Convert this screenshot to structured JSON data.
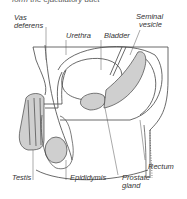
{
  "figure": {
    "caption_partial": "form the ejaculatory duct",
    "labels": {
      "vas_deferens_line1": "Vas",
      "vas_deferens_line2": "deferens",
      "urethra": "Urethra",
      "bladder": "Bladder",
      "seminal_vesicle_line1": "Seminal",
      "seminal_vesicle_line2": "vesicle",
      "rectum": "Rectum",
      "testis": "Testis",
      "epididymis": "Epididymis",
      "prostate_gland_line1": "Prostate",
      "prostate_gland_line2": "gland"
    },
    "colors": {
      "line": "#444444",
      "fill_organ": "#c8c8c8",
      "background": "#ffffff"
    }
  }
}
